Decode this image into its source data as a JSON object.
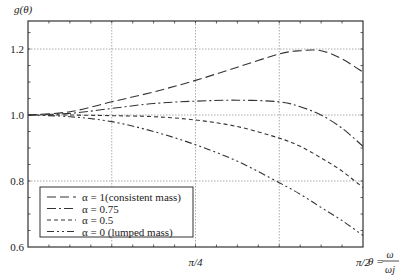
{
  "chart_data": {
    "type": "line",
    "title": "",
    "ylabel": "g(θ)",
    "xlabel": "θ = ω/ωj",
    "xlabel_parts": {
      "lhs": "θ =",
      "num": "ω",
      "den": "ωj"
    },
    "xlim": [
      0,
      1.5708
    ],
    "ylim": [
      0.6,
      1.285
    ],
    "x_ticks": [
      {
        "value": 0.7854,
        "label": "π/4"
      },
      {
        "value": 1.5708,
        "label": "π/2"
      }
    ],
    "x_gridlines": [
      0.3927,
      0.7854,
      1.1781
    ],
    "y_ticks": [
      {
        "value": 0.6,
        "label": "0.6"
      },
      {
        "value": 0.8,
        "label": "0.8"
      },
      {
        "value": 1.0,
        "label": "1.0"
      },
      {
        "value": 1.2,
        "label": "1.2"
      }
    ],
    "grid": true,
    "legend_position": "lower left",
    "x": [
      0,
      0.1963,
      0.3927,
      0.589,
      0.7854,
      0.9817,
      1.1781,
      1.2763,
      1.3744,
      1.4726,
      1.5708
    ],
    "series": [
      {
        "name": "α = 1(consistent mass)",
        "dash": "9,4",
        "values": [
          1.0,
          1.01,
          1.04,
          1.07,
          1.105,
          1.145,
          1.185,
          1.195,
          1.195,
          1.17,
          1.13
        ]
      },
      {
        "name": "α = 0.75",
        "dash": "9,3,2,3",
        "values": [
          1.0,
          1.005,
          1.02,
          1.035,
          1.042,
          1.045,
          1.04,
          1.025,
          1.0,
          0.96,
          0.905
        ]
      },
      {
        "name": "α = 0.5",
        "dash": "4,3",
        "values": [
          1.0,
          1.0,
          0.998,
          0.995,
          0.985,
          0.965,
          0.93,
          0.905,
          0.87,
          0.83,
          0.78
        ]
      },
      {
        "name": "α = 0 (lumped mass)",
        "dash": "7,3,2,3,2,3",
        "values": [
          1.0,
          0.995,
          0.98,
          0.95,
          0.91,
          0.86,
          0.795,
          0.76,
          0.72,
          0.68,
          0.635
        ]
      }
    ]
  }
}
